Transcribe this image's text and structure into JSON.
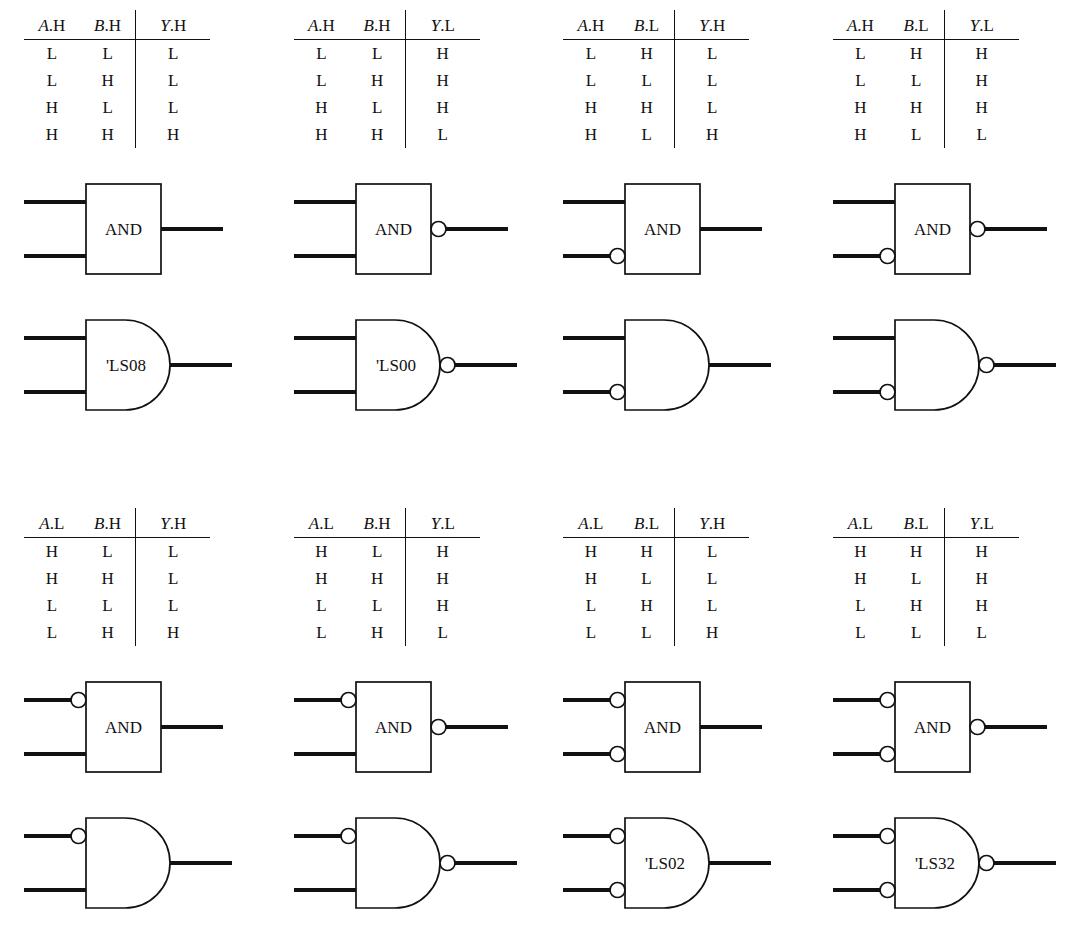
{
  "figure": {
    "kind": "logic-gate-equivalence-figure",
    "blocks": [
      {
        "id": "block-1",
        "table": {
          "headers": [
            {
              "var": "A",
              "suffix": ".H"
            },
            {
              "var": "B",
              "suffix": ".H"
            },
            {
              "var": "Y",
              "suffix": ".H"
            }
          ],
          "rows": [
            [
              "L",
              "L",
              "L"
            ],
            [
              "L",
              "H",
              "L"
            ],
            [
              "H",
              "L",
              "L"
            ],
            [
              "H",
              "H",
              "H"
            ]
          ]
        },
        "rect_gate": {
          "label": "AND",
          "input_bubbles": [
            false,
            false
          ],
          "output_bubble": false
        },
        "dist_gate": {
          "label": "'LS08",
          "input_bubbles": [
            false,
            false
          ],
          "output_bubble": false
        }
      },
      {
        "id": "block-2",
        "table": {
          "headers": [
            {
              "var": "A",
              "suffix": ".H"
            },
            {
              "var": "B",
              "suffix": ".H"
            },
            {
              "var": "Y",
              "suffix": ".L"
            }
          ],
          "rows": [
            [
              "L",
              "L",
              "H"
            ],
            [
              "L",
              "H",
              "H"
            ],
            [
              "H",
              "L",
              "H"
            ],
            [
              "H",
              "H",
              "L"
            ]
          ]
        },
        "rect_gate": {
          "label": "AND",
          "input_bubbles": [
            false,
            false
          ],
          "output_bubble": true
        },
        "dist_gate": {
          "label": "'LS00",
          "input_bubbles": [
            false,
            false
          ],
          "output_bubble": true
        }
      },
      {
        "id": "block-3",
        "table": {
          "headers": [
            {
              "var": "A",
              "suffix": ".H"
            },
            {
              "var": "B",
              "suffix": ".L"
            },
            {
              "var": "Y",
              "suffix": ".H"
            }
          ],
          "rows": [
            [
              "L",
              "H",
              "L"
            ],
            [
              "L",
              "L",
              "L"
            ],
            [
              "H",
              "H",
              "L"
            ],
            [
              "H",
              "L",
              "H"
            ]
          ]
        },
        "rect_gate": {
          "label": "AND",
          "input_bubbles": [
            false,
            true
          ],
          "output_bubble": false
        },
        "dist_gate": {
          "label": "",
          "input_bubbles": [
            false,
            true
          ],
          "output_bubble": false
        }
      },
      {
        "id": "block-4",
        "table": {
          "headers": [
            {
              "var": "A",
              "suffix": ".H"
            },
            {
              "var": "B",
              "suffix": ".L"
            },
            {
              "var": "Y",
              "suffix": ".L"
            }
          ],
          "rows": [
            [
              "L",
              "H",
              "H"
            ],
            [
              "L",
              "L",
              "H"
            ],
            [
              "H",
              "H",
              "H"
            ],
            [
              "H",
              "L",
              "L"
            ]
          ]
        },
        "rect_gate": {
          "label": "AND",
          "input_bubbles": [
            false,
            true
          ],
          "output_bubble": true
        },
        "dist_gate": {
          "label": "",
          "input_bubbles": [
            false,
            true
          ],
          "output_bubble": true
        }
      },
      {
        "id": "block-5",
        "table": {
          "headers": [
            {
              "var": "A",
              "suffix": ".L"
            },
            {
              "var": "B",
              "suffix": ".H"
            },
            {
              "var": "Y",
              "suffix": ".H"
            }
          ],
          "rows": [
            [
              "H",
              "L",
              "L"
            ],
            [
              "H",
              "H",
              "L"
            ],
            [
              "L",
              "L",
              "L"
            ],
            [
              "L",
              "H",
              "H"
            ]
          ]
        },
        "rect_gate": {
          "label": "AND",
          "input_bubbles": [
            true,
            false
          ],
          "output_bubble": false
        },
        "dist_gate": {
          "label": "",
          "input_bubbles": [
            true,
            false
          ],
          "output_bubble": false
        }
      },
      {
        "id": "block-6",
        "table": {
          "headers": [
            {
              "var": "A",
              "suffix": ".L"
            },
            {
              "var": "B",
              "suffix": ".H"
            },
            {
              "var": "Y",
              "suffix": ".L"
            }
          ],
          "rows": [
            [
              "H",
              "L",
              "H"
            ],
            [
              "H",
              "H",
              "H"
            ],
            [
              "L",
              "L",
              "H"
            ],
            [
              "L",
              "H",
              "L"
            ]
          ]
        },
        "rect_gate": {
          "label": "AND",
          "input_bubbles": [
            true,
            false
          ],
          "output_bubble": true
        },
        "dist_gate": {
          "label": "",
          "input_bubbles": [
            true,
            false
          ],
          "output_bubble": true
        }
      },
      {
        "id": "block-7",
        "table": {
          "headers": [
            {
              "var": "A",
              "suffix": ".L"
            },
            {
              "var": "B",
              "suffix": ".L"
            },
            {
              "var": "Y",
              "suffix": ".H"
            }
          ],
          "rows": [
            [
              "H",
              "H",
              "L"
            ],
            [
              "H",
              "L",
              "L"
            ],
            [
              "L",
              "H",
              "L"
            ],
            [
              "L",
              "L",
              "H"
            ]
          ]
        },
        "rect_gate": {
          "label": "AND",
          "input_bubbles": [
            true,
            true
          ],
          "output_bubble": false
        },
        "dist_gate": {
          "label": "'LS02",
          "input_bubbles": [
            true,
            true
          ],
          "output_bubble": false
        }
      },
      {
        "id": "block-8",
        "table": {
          "headers": [
            {
              "var": "A",
              "suffix": ".L"
            },
            {
              "var": "B",
              "suffix": ".L"
            },
            {
              "var": "Y",
              "suffix": ".L"
            }
          ],
          "rows": [
            [
              "H",
              "H",
              "H"
            ],
            [
              "H",
              "L",
              "H"
            ],
            [
              "L",
              "H",
              "H"
            ],
            [
              "L",
              "L",
              "L"
            ]
          ]
        },
        "rect_gate": {
          "label": "AND",
          "input_bubbles": [
            true,
            true
          ],
          "output_bubble": true
        },
        "dist_gate": {
          "label": "'LS32",
          "input_bubbles": [
            true,
            true
          ],
          "output_bubble": true
        }
      }
    ]
  },
  "colors": {
    "ink": "#111111",
    "paper": "#ffffff"
  }
}
